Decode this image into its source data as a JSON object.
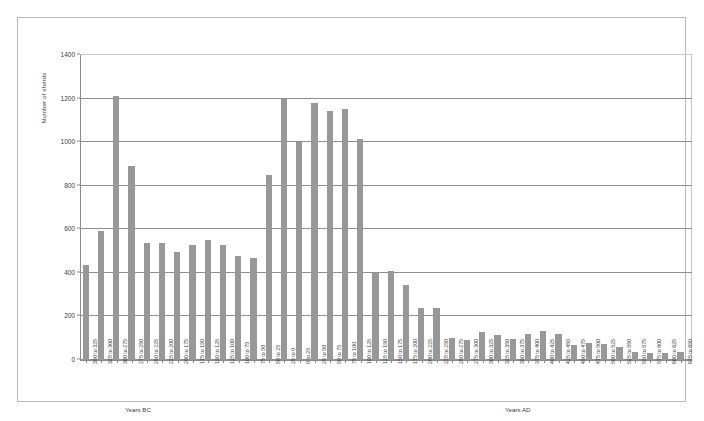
{
  "chart_data": {
    "type": "bar",
    "title": "",
    "xlabel": "",
    "ylabel": "Number of sherds",
    "ylim": [
      0,
      1400
    ],
    "yticks": [
      0,
      200,
      400,
      600,
      800,
      1000,
      1200,
      1400
    ],
    "grid": true,
    "legend": "none",
    "bar_color": "#989898",
    "era_labels": [
      {
        "text": "Years BC",
        "position": "left"
      },
      {
        "text": "Years AD",
        "position": "right"
      }
    ],
    "categories": [
      "350 to 325",
      "325 to 300",
      "300 to 275",
      "275 to 250",
      "250 to 225",
      "225 to 200",
      "200 to 175",
      "175 to 150",
      "150 to 125",
      "125 to 100",
      "100 to 75",
      "75 to 50",
      "50 to 25",
      "25 to 0",
      "0 to 25",
      "25 to 50",
      "50 to 75",
      "75 to 100",
      "100 to 125",
      "125 to 150",
      "150 to 175",
      "175 to 200",
      "200 to 225",
      "225 to 250",
      "250 to 275",
      "275 to 300",
      "300 to 325",
      "325 to 350",
      "350 to 375",
      "375 to 400",
      "400 to 425",
      "425 to 450",
      "450 to 475",
      "475 to 500",
      "500 to 525",
      "525 to 550",
      "550 to 575",
      "575 to 600",
      "600 to 625",
      "625 to 650"
    ],
    "values": [
      437,
      590,
      1212,
      890,
      535,
      535,
      495,
      530,
      550,
      530,
      477,
      468,
      848,
      1198,
      1000,
      1180,
      1143,
      1150,
      1013,
      400,
      410,
      345,
      240,
      240,
      100,
      93,
      128,
      115,
      98,
      120,
      135,
      118,
      70,
      78,
      72,
      60,
      35,
      32,
      30,
      38
    ]
  }
}
